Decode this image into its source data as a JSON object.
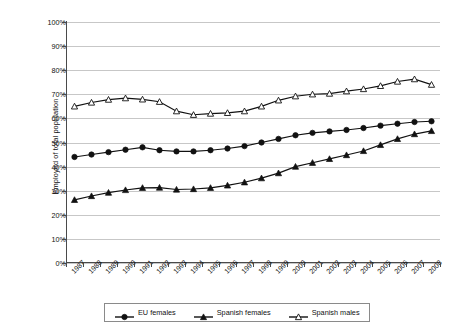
{
  "chart_data": {
    "type": "line",
    "title": "",
    "xlabel": "",
    "ylabel": "Employed of total population",
    "ylim": [
      0,
      100
    ],
    "ytick_labels": [
      "0%",
      "10%",
      "20%",
      "30%",
      "40%",
      "50%",
      "60%",
      "70%",
      "80%",
      "90%",
      "100%"
    ],
    "ytick_values": [
      0,
      10,
      20,
      30,
      40,
      50,
      60,
      70,
      80,
      90,
      100
    ],
    "grid": "horizontal",
    "legend_position": "bottom",
    "categories": [
      "1987",
      "1988",
      "1989",
      "1990",
      "1991",
      "1992",
      "1993",
      "1994",
      "1995",
      "1996",
      "1997",
      "1998",
      "1999",
      "2000",
      "2001",
      "2002",
      "2003",
      "2004",
      "2005",
      "2006",
      "2007",
      "2008"
    ],
    "series": [
      {
        "name": "EU females",
        "marker": "filled-circle",
        "values": [
          44.0,
          45.0,
          46.0,
          47.0,
          48.0,
          46.8,
          46.3,
          46.3,
          46.8,
          47.5,
          48.5,
          50.0,
          51.5,
          53.0,
          54.0,
          54.6,
          55.2,
          56.0,
          57.0,
          57.8,
          58.5,
          58.8
        ]
      },
      {
        "name": "Spanish females",
        "marker": "filled-triangle",
        "values": [
          26.2,
          27.8,
          29.2,
          30.3,
          31.2,
          31.3,
          30.5,
          30.7,
          31.2,
          32.2,
          33.5,
          35.2,
          37.3,
          40.0,
          41.6,
          43.2,
          44.8,
          46.5,
          49.0,
          51.5,
          53.5,
          54.8
        ]
      },
      {
        "name": "Spanish males",
        "marker": "open-triangle",
        "values": [
          65.0,
          66.6,
          67.8,
          68.4,
          67.9,
          66.9,
          63.0,
          61.5,
          62.0,
          62.3,
          63.0,
          65.0,
          67.5,
          69.2,
          70.0,
          70.3,
          71.3,
          72.2,
          73.5,
          75.3,
          76.3,
          74.0
        ]
      }
    ]
  },
  "legend": {
    "items": [
      {
        "label": "EU females",
        "marker": "filled-circle"
      },
      {
        "label": "Spanish females",
        "marker": "filled-triangle"
      },
      {
        "label": "Spanish males",
        "marker": "open-triangle"
      }
    ]
  }
}
